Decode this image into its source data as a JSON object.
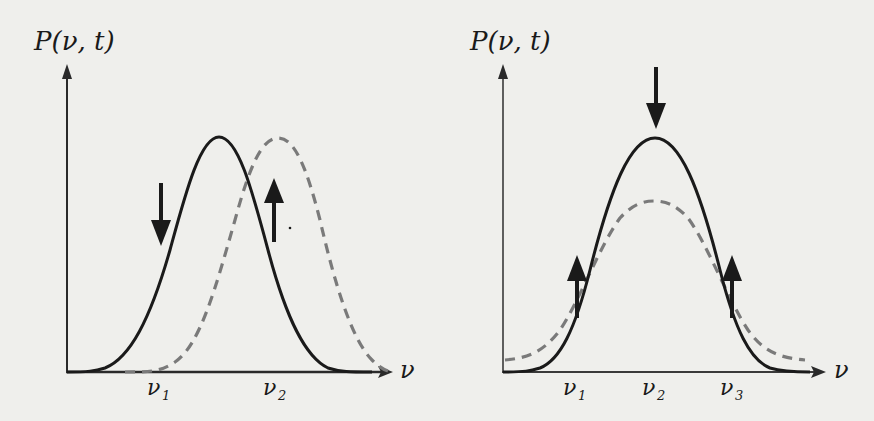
{
  "figure": {
    "colors": {
      "background": "#efefec",
      "solid_curve": "#1a1a1a",
      "dashed_curve": "#7a7a7a",
      "axis": "#2a2a2a",
      "arrow": "#1a1a1a"
    }
  },
  "left_panel": {
    "y_label": "P(ν, t)",
    "x_label": "ν",
    "ticks": [
      {
        "label": "ν",
        "sub": "1"
      },
      {
        "label": "ν",
        "sub": "2"
      }
    ],
    "curves": [
      {
        "style": "solid",
        "name": "initial distribution",
        "peak_x_tick": "between ν1 and ν2"
      },
      {
        "style": "dashed",
        "name": "shifted distribution",
        "peak_x_tick": "ν2"
      }
    ],
    "arrows": [
      {
        "direction": "down",
        "position": "near ν1 on rising side of solid curve"
      },
      {
        "direction": "up",
        "position": "near ν2 between curves"
      }
    ]
  },
  "right_panel": {
    "y_label": "P(ν, t)",
    "x_label": "ν",
    "ticks": [
      {
        "label": "ν",
        "sub": "1"
      },
      {
        "label": "ν",
        "sub": "2"
      },
      {
        "label": "ν",
        "sub": "3"
      }
    ],
    "curves": [
      {
        "style": "solid",
        "name": "narrow distribution",
        "peak_x_tick": "ν2"
      },
      {
        "style": "dashed",
        "name": "broadened distribution",
        "peak_x_tick": "ν2"
      }
    ],
    "arrows": [
      {
        "direction": "down",
        "position": "above peak at ν2"
      },
      {
        "direction": "up",
        "position": "at ν1"
      },
      {
        "direction": "up",
        "position": "at ν3"
      }
    ]
  }
}
